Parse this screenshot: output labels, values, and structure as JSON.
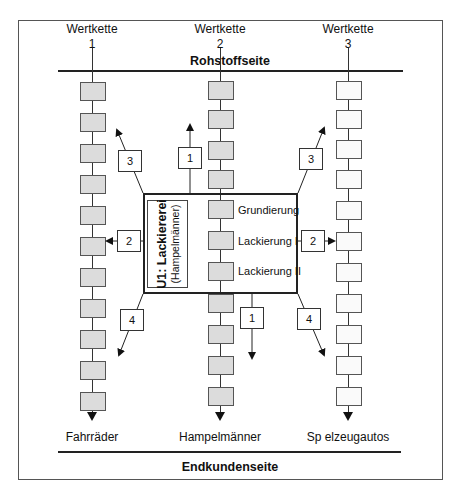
{
  "diagram": {
    "top_side_label": "Rohstoffseite",
    "bottom_side_label": "Endkundenseite",
    "value_chains": [
      {
        "title": "Wertkette",
        "number": "1",
        "product": "Fahrräder",
        "box_fill": "gray",
        "box_count": 11
      },
      {
        "title": "Wertkette",
        "number": "2",
        "product": "Hampelmänner",
        "box_fill": "gray",
        "box_count": 11
      },
      {
        "title": "Wertkette",
        "number": "3",
        "product": "Sp elzeugautos",
        "box_fill": "white",
        "box_count": 11
      }
    ],
    "unit": {
      "title": "U1: Lackiererei",
      "subtitle": "(Hampelmänner)",
      "steps": [
        "Grundierung",
        "Lackierung I",
        "Lackierung II"
      ]
    },
    "relations": [
      {
        "label": "1",
        "position": "top-center",
        "direction": "up"
      },
      {
        "label": "1",
        "position": "bottom-center",
        "direction": "down"
      },
      {
        "label": "2",
        "position": "left",
        "direction": "to chain 1"
      },
      {
        "label": "2",
        "position": "right",
        "direction": "to chain 3"
      },
      {
        "label": "3",
        "position": "top-left",
        "direction": "up-left"
      },
      {
        "label": "3",
        "position": "top-right",
        "direction": "up-right"
      },
      {
        "label": "4",
        "position": "bottom-left",
        "direction": "down-left"
      },
      {
        "label": "4",
        "position": "bottom-right",
        "direction": "down-right"
      }
    ],
    "colors": {
      "gray_box": "#dcdcdc",
      "white_box": "#fafafa",
      "line": "#222222"
    }
  }
}
